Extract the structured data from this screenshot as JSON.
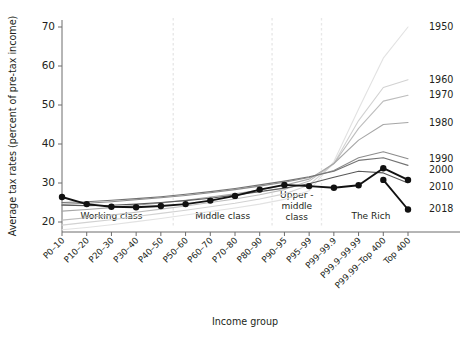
{
  "chart_data": {
    "type": "line",
    "title": "",
    "xlabel": "Income group",
    "ylabel": "Average tax rates (percent of pre-tax income)",
    "ylim": [
      15,
      73
    ],
    "yticks": [
      20,
      30,
      40,
      50,
      60,
      70
    ],
    "grid": "vertical-dashed",
    "legend_position": "right-inline-labels",
    "categories": [
      "P0–10",
      "P10–20",
      "P20–30",
      "P30–40",
      "P40–50",
      "P50–60",
      "P60–70",
      "P70–80",
      "P80–90",
      "P90–95",
      "P95–99",
      "P99–99.9",
      "P99.9–99.99",
      "P99.99–Top 400",
      "Top 400"
    ],
    "bands": [
      {
        "label": "Working class",
        "start_index": 0,
        "end_index": 4
      },
      {
        "label": "Middle class",
        "start_index": 5,
        "end_index": 8
      },
      {
        "label": "Upper -\nmiddle\nclass",
        "label_lines": [
          "Upper -",
          "middle",
          "class"
        ],
        "start_index": 9,
        "end_index": 10
      },
      {
        "label": "The Rich",
        "start_index": 11,
        "end_index": 14
      }
    ],
    "band_dividers": [
      4.5,
      8.5,
      10.5
    ],
    "series": [
      {
        "name": "1950",
        "color": "#e2e2e2",
        "width": 1.1,
        "markers": false,
        "values": [
          18.0,
          18.6,
          19.3,
          20.1,
          20.9,
          21.8,
          22.7,
          23.6,
          24.6,
          25.8,
          28.0,
          35.5,
          49.0,
          62.0,
          70.0
        ]
      },
      {
        "name": "1960",
        "color": "#d2d2d2",
        "width": 1.1,
        "markers": false,
        "values": [
          19.2,
          19.9,
          20.6,
          21.4,
          22.2,
          23.0,
          23.9,
          24.8,
          25.9,
          27.2,
          29.5,
          35.0,
          46.0,
          54.5,
          56.5
        ]
      },
      {
        "name": "1970",
        "color": "#bdbdbd",
        "width": 1.1,
        "markers": false,
        "values": [
          20.5,
          21.1,
          21.8,
          22.5,
          23.3,
          24.1,
          25.0,
          25.9,
          27.0,
          28.3,
          30.5,
          35.0,
          44.0,
          51.0,
          52.5
        ]
      },
      {
        "name": "1980",
        "color": "#a6a6a6",
        "width": 1.1,
        "markers": false,
        "values": [
          22.8,
          23.2,
          23.7,
          24.3,
          24.9,
          25.6,
          26.4,
          27.2,
          28.2,
          29.4,
          31.0,
          35.0,
          41.0,
          45.0,
          45.5
        ]
      },
      {
        "name": "1990",
        "color": "#8c8c8c",
        "width": 1.1,
        "markers": false,
        "values": [
          24.5,
          24.8,
          25.2,
          25.7,
          26.2,
          26.8,
          27.5,
          28.3,
          29.2,
          30.2,
          31.4,
          33.2,
          36.5,
          38.0,
          36.2
        ]
      },
      {
        "name": "2000",
        "color": "#737373",
        "width": 1.1,
        "markers": false,
        "values": [
          25.0,
          25.2,
          25.6,
          26.0,
          26.5,
          27.1,
          27.8,
          28.6,
          29.5,
          30.5,
          31.6,
          33.0,
          35.8,
          36.5,
          34.5
        ]
      },
      {
        "name": "2010",
        "color": "#595959",
        "width": 1.1,
        "markers": false,
        "values": [
          24.3,
          24.2,
          24.3,
          24.6,
          25.0,
          25.5,
          26.1,
          26.9,
          27.8,
          28.7,
          29.8,
          31.5,
          33.0,
          32.6,
          30.0
        ]
      },
      {
        "name": "2018",
        "color": "#111111",
        "width": 1.9,
        "markers": true,
        "values": [
          26.4,
          24.6,
          23.9,
          23.8,
          24.1,
          24.6,
          25.5,
          26.7,
          28.3,
          29.5,
          29.2,
          28.8,
          29.4,
          33.8,
          30.8
        ]
      },
      {
        "name": "2018-tail",
        "hidden_label": true,
        "color": "#111111",
        "width": 1.9,
        "markers": true,
        "values": [
          null,
          null,
          null,
          null,
          null,
          null,
          null,
          null,
          null,
          null,
          null,
          null,
          null,
          30.8,
          23.2
        ]
      }
    ],
    "series_labels": [
      {
        "text": "1950",
        "y_value": 70.0
      },
      {
        "text": "1960",
        "y_value": 56.5
      },
      {
        "text": "1970",
        "y_value": 52.5
      },
      {
        "text": "1980",
        "y_value": 45.5
      },
      {
        "text": "1990",
        "y_value": 36.2
      },
      {
        "text": "2000",
        "y_value": 33.3
      },
      {
        "text": "2010",
        "y_value": 29.0
      },
      {
        "text": "2018",
        "y_value": 23.4
      }
    ]
  }
}
